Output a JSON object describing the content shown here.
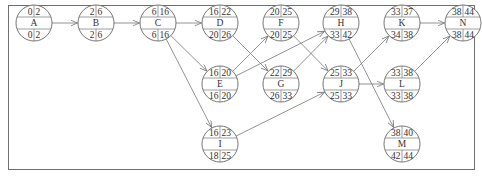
{
  "diagram": {
    "type": "activity-on-node network",
    "node_radius": 18,
    "nodes": [
      {
        "id": "A",
        "x": 34,
        "y": 23,
        "es": "0",
        "ef": "2",
        "ls": "0",
        "lf": "2"
      },
      {
        "id": "B",
        "x": 96,
        "y": 23,
        "es": "2",
        "ef": "6",
        "ls": "2",
        "lf": "6"
      },
      {
        "id": "C",
        "x": 158,
        "y": 23,
        "es": "6",
        "ef": "16",
        "ls": "6",
        "lf": "16"
      },
      {
        "id": "D",
        "x": 220,
        "y": 23,
        "es": "16",
        "ef": "22",
        "ls": "20",
        "lf": "26"
      },
      {
        "id": "F",
        "x": 281,
        "y": 23,
        "es": "20",
        "ef": "25",
        "ls": "20",
        "lf": "25"
      },
      {
        "id": "H",
        "x": 341,
        "y": 23,
        "es": "29",
        "ef": "38",
        "ls": "33",
        "lf": "42"
      },
      {
        "id": "K",
        "x": 402,
        "y": 23,
        "es": "33",
        "ef": "37",
        "ls": "34",
        "lf": "38"
      },
      {
        "id": "N",
        "x": 463,
        "y": 23,
        "es": "38",
        "ef": "44",
        "ls": "38",
        "lf": "44"
      },
      {
        "id": "E",
        "x": 220,
        "y": 84,
        "es": "16",
        "ef": "20",
        "ls": "16",
        "lf": "20"
      },
      {
        "id": "G",
        "x": 281,
        "y": 84,
        "es": "22",
        "ef": "29",
        "ls": "26",
        "lf": "33"
      },
      {
        "id": "J",
        "x": 341,
        "y": 84,
        "es": "25",
        "ef": "33",
        "ls": "25",
        "lf": "33"
      },
      {
        "id": "L",
        "x": 402,
        "y": 84,
        "es": "33",
        "ef": "38",
        "ls": "33",
        "lf": "38"
      },
      {
        "id": "I",
        "x": 220,
        "y": 144,
        "es": "16",
        "ef": "23",
        "ls": "18",
        "lf": "25"
      },
      {
        "id": "M",
        "x": 402,
        "y": 144,
        "es": "38",
        "ef": "40",
        "ls": "42",
        "lf": "44"
      }
    ],
    "edges": [
      {
        "from": "A",
        "to": "B"
      },
      {
        "from": "B",
        "to": "C"
      },
      {
        "from": "C",
        "to": "D"
      },
      {
        "from": "C",
        "to": "E"
      },
      {
        "from": "C",
        "to": "I"
      },
      {
        "from": "D",
        "to": "G"
      },
      {
        "from": "E",
        "to": "F"
      },
      {
        "from": "E",
        "to": "H"
      },
      {
        "from": "F",
        "to": "J"
      },
      {
        "from": "G",
        "to": "H"
      },
      {
        "from": "I",
        "to": "J"
      },
      {
        "from": "H",
        "to": "M"
      },
      {
        "from": "J",
        "to": "K"
      },
      {
        "from": "J",
        "to": "L"
      },
      {
        "from": "K",
        "to": "N"
      },
      {
        "from": "L",
        "to": "N"
      }
    ],
    "colors": {
      "stroke": "#666666",
      "text": "#333333",
      "background": "#ffffff"
    }
  }
}
